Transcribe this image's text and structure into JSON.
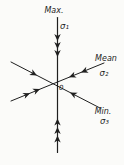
{
  "diagram": {
    "kind": "principal-stress-axes",
    "background": "#fbfbf9",
    "ink": "#1f1f1f",
    "origin": {
      "label": "0"
    },
    "axes": {
      "max": {
        "label": "Max.",
        "symbol": "σ₁",
        "arrowheads_per_side": 3,
        "direction": "vertical"
      },
      "mean": {
        "label": "Mean",
        "symbol": "σ₂",
        "arrowheads_per_side": 2,
        "direction": "lower-left to upper-right"
      },
      "min": {
        "label": "Min.",
        "symbol": "σ₃",
        "arrowheads_per_side": 1,
        "direction": "upper-left to lower-right"
      }
    }
  }
}
